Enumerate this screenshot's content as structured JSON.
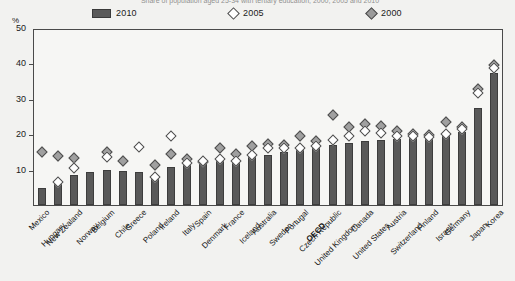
{
  "title": "Share of population aged 25-34 with tertiary education, 2000, 2005 and 2010",
  "axis": {
    "unit_label": "%",
    "yticks": [
      "50",
      "40",
      "30",
      "20",
      "10"
    ],
    "ylim": [
      0,
      50
    ]
  },
  "legend": {
    "items": [
      {
        "label": "2010",
        "marker": "bar-swatch",
        "color": "#5a5a5a"
      },
      {
        "label": "2005",
        "marker": "hollow-diamond",
        "color": "#ffffff"
      },
      {
        "label": "2000",
        "marker": "solid-diamond",
        "color": "#9a9a9a"
      }
    ]
  },
  "chart_data": {
    "type": "bar",
    "title": "Share of population aged 25-34 with tertiary education, 2000, 2005 and 2010",
    "xlabel": "",
    "ylabel": "%",
    "ylim": [
      0,
      50
    ],
    "grid": false,
    "legend_position": "top",
    "categories": [
      "Mexico",
      "Hungary",
      "New Zealand",
      "Norway",
      "Belgium",
      "Chile",
      "Greece",
      "Poland",
      "Ireland",
      "Italy",
      "Spain",
      "Denmark",
      "France",
      "Iceland",
      "Australia",
      "Sweden",
      "Portugal",
      "OECD",
      "Czech Republic",
      "United Kingdom",
      "Canada",
      "United States",
      "Austria",
      "Switzerland",
      "Finland",
      "Israel*",
      "Germany",
      "Japan",
      "Korea"
    ],
    "series": [
      {
        "name": "2010",
        "marker": "bar",
        "values": [
          5.0,
          6.2,
          8.7,
          9.5,
          10.0,
          9.8,
          9.6,
          8.5,
          11.0,
          11.5,
          12.0,
          12.8,
          13.2,
          13.8,
          14.5,
          15.2,
          15.8,
          16.5,
          17.2,
          17.8,
          18.5,
          18.8,
          19.0,
          19.2,
          19.5,
          20.0,
          21.0,
          27.8,
          38.0
        ]
      },
      {
        "name": "2005",
        "marker": "hollow-diamond",
        "values": [
          null,
          6.2,
          10.3,
          null,
          13.5,
          null,
          16.3,
          7.8,
          19.5,
          11.8,
          12.5,
          13.0,
          12.5,
          14.0,
          16.0,
          16.2,
          16.0,
          16.8,
          18.5,
          19.5,
          21.0,
          20.5,
          19.5,
          19.5,
          19.3,
          20.0,
          21.5,
          32.0,
          39.0
        ]
      },
      {
        "name": "2000",
        "marker": "solid-diamond",
        "values": [
          14.8,
          13.8,
          13.2,
          null,
          15.0,
          12.5,
          null,
          11.2,
          14.5,
          13.0,
          12.0,
          16.0,
          14.5,
          16.8,
          17.2,
          17.0,
          19.5,
          18.0,
          25.5,
          22.0,
          23.0,
          22.5,
          21.0,
          20.0,
          19.8,
          23.5,
          22.0,
          33.0,
          40.0
        ]
      }
    ]
  },
  "note": "Israel*"
}
